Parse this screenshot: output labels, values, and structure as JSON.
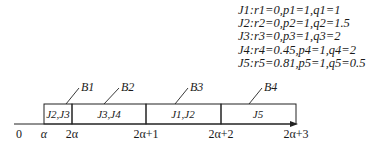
{
  "legend": [
    {
      "job": "J1",
      "r": "0",
      "p": "1",
      "q": "1",
      "text": "J1:r1=0,p1=1,q1=1"
    },
    {
      "job": "J2",
      "r": "0",
      "p": "1",
      "q": "1.5",
      "text": "J2:r2=0,p2=1,q2=1.5"
    },
    {
      "job": "J3",
      "r": "0",
      "p": "1",
      "q": "2",
      "text": "J3:r3=0,p3=1,q3=2"
    },
    {
      "job": "J4",
      "r": "0.45",
      "p": "1",
      "q": "2",
      "text": "J4:r4=0.45,p4=1,q4=2"
    },
    {
      "job": "J5",
      "r": "0.81",
      "p": "1",
      "q": "0.5",
      "text": "J5:r5=0.81,p5=1,q5=0.5"
    }
  ],
  "axis": {
    "ticks": [
      "0",
      "α",
      "2α",
      "2α+1",
      "2α+2",
      "2α+3"
    ]
  },
  "batches": [
    {
      "label": "B1",
      "jobs": "J2,J3"
    },
    {
      "label": "B2",
      "jobs": "J3,J4"
    },
    {
      "label": "B3",
      "jobs": "J1,J2"
    },
    {
      "label": "B4",
      "jobs": "J5"
    }
  ]
}
